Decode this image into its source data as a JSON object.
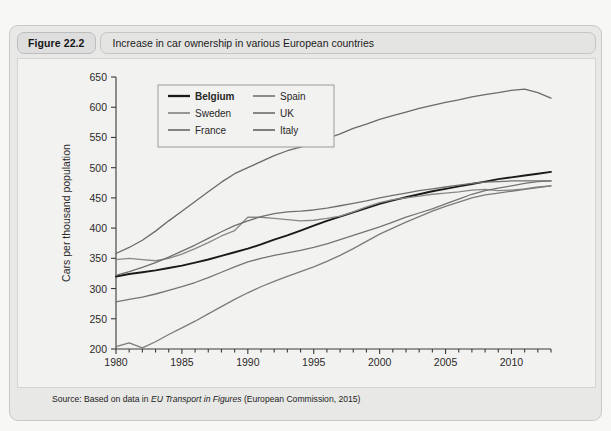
{
  "figure": {
    "number_label": "Figure 22.2",
    "caption": "Increase in car ownership in various European countries"
  },
  "source": {
    "prefix": "Source: Based on data in ",
    "italic_title": "EU Transport in Figures",
    "suffix": " (European Commission, 2015)"
  },
  "chart_data": {
    "type": "line",
    "title": "Increase in car ownership in various European countries",
    "xlabel": "",
    "ylabel": "Cars per thousand population",
    "xlim": [
      1980,
      2013
    ],
    "ylim": [
      200,
      650
    ],
    "ytick_step": 50,
    "yticks": [
      200,
      250,
      300,
      350,
      400,
      450,
      500,
      550,
      600,
      650
    ],
    "xticks": [
      1980,
      1985,
      1990,
      1995,
      2000,
      2005,
      2010
    ],
    "xtick_minor_step": 1,
    "grid": false,
    "legend_position": "upper-left-inside",
    "legend_columns": 2,
    "x": [
      1980,
      1981,
      1982,
      1983,
      1984,
      1985,
      1986,
      1987,
      1988,
      1989,
      1990,
      1991,
      1992,
      1993,
      1994,
      1995,
      1996,
      1997,
      1998,
      1999,
      2000,
      2001,
      2002,
      2003,
      2004,
      2005,
      2006,
      2007,
      2008,
      2009,
      2010,
      2011,
      2012,
      2013
    ],
    "series": [
      {
        "name": "Belgium",
        "color": "#1a1a1a",
        "width": 1.9,
        "values": [
          320,
          324,
          327,
          330,
          334,
          338,
          343,
          348,
          354,
          360,
          366,
          373,
          381,
          388,
          396,
          404,
          412,
          419,
          426,
          433,
          440,
          446,
          451,
          456,
          461,
          465,
          469,
          473,
          477,
          481,
          484,
          487,
          490,
          493
        ]
      },
      {
        "name": "Sweden",
        "color": "#888888",
        "width": 1.3,
        "values": [
          348,
          350,
          348,
          346,
          350,
          357,
          366,
          376,
          387,
          396,
          418,
          418,
          416,
          414,
          412,
          413,
          416,
          420,
          427,
          435,
          442,
          447,
          450,
          453,
          456,
          458,
          460,
          463,
          464,
          462,
          463,
          465,
          468,
          470
        ]
      },
      {
        "name": "France",
        "color": "#6f6f6f",
        "width": 1.3,
        "values": [
          322,
          328,
          335,
          343,
          352,
          362,
          372,
          383,
          394,
          404,
          412,
          419,
          424,
          427,
          428,
          430,
          433,
          437,
          441,
          445,
          450,
          454,
          458,
          462,
          465,
          468,
          471,
          474,
          476,
          477,
          478,
          478,
          478,
          478
        ]
      },
      {
        "name": "Spain",
        "color": "#7b7b7b",
        "width": 1.3,
        "values": [
          204,
          210,
          202,
          212,
          224,
          235,
          246,
          258,
          270,
          282,
          293,
          303,
          312,
          320,
          328,
          336,
          345,
          355,
          366,
          378,
          390,
          400,
          410,
          419,
          428,
          436,
          443,
          450,
          455,
          458,
          461,
          464,
          467,
          470
        ]
      },
      {
        "name": "UK",
        "color": "#747474",
        "width": 1.3,
        "values": [
          278,
          282,
          286,
          291,
          297,
          303,
          310,
          318,
          327,
          336,
          344,
          350,
          355,
          359,
          363,
          368,
          374,
          381,
          388,
          395,
          402,
          410,
          418,
          425,
          432,
          440,
          448,
          456,
          462,
          466,
          470,
          474,
          477,
          478
        ]
      },
      {
        "name": "Italy",
        "color": "#6a6a6a",
        "width": 1.3,
        "values": [
          358,
          368,
          380,
          395,
          412,
          428,
          444,
          460,
          476,
          490,
          500,
          510,
          520,
          528,
          534,
          540,
          548,
          556,
          565,
          572,
          580,
          586,
          592,
          598,
          603,
          608,
          612,
          617,
          621,
          624,
          628,
          630,
          624,
          615
        ]
      }
    ]
  }
}
